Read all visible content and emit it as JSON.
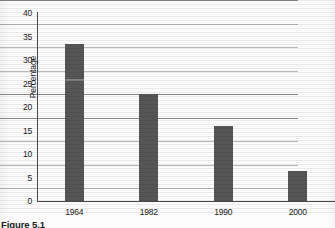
{
  "figure": {
    "caption": "Figure 5.1",
    "bar_color": "#565656",
    "axis_color": "#4a4a4a",
    "gridline_color": "#b9b9b9"
  },
  "chart_data": {
    "type": "bar",
    "title": "",
    "xlabel": "",
    "ylabel": "Percentage",
    "categories": [
      "1964",
      "1982",
      "1990",
      "2000"
    ],
    "values": [
      33.5,
      22.8,
      16.0,
      6.4
    ],
    "ylim": [
      0,
      40
    ],
    "ytick_labels": [
      "0",
      "5",
      "10",
      "15",
      "20",
      "25",
      "30",
      "35",
      "40"
    ],
    "ytick_values": [
      0,
      5,
      10,
      15,
      20,
      25,
      30,
      35,
      40
    ],
    "grid": true,
    "legend": "none"
  }
}
